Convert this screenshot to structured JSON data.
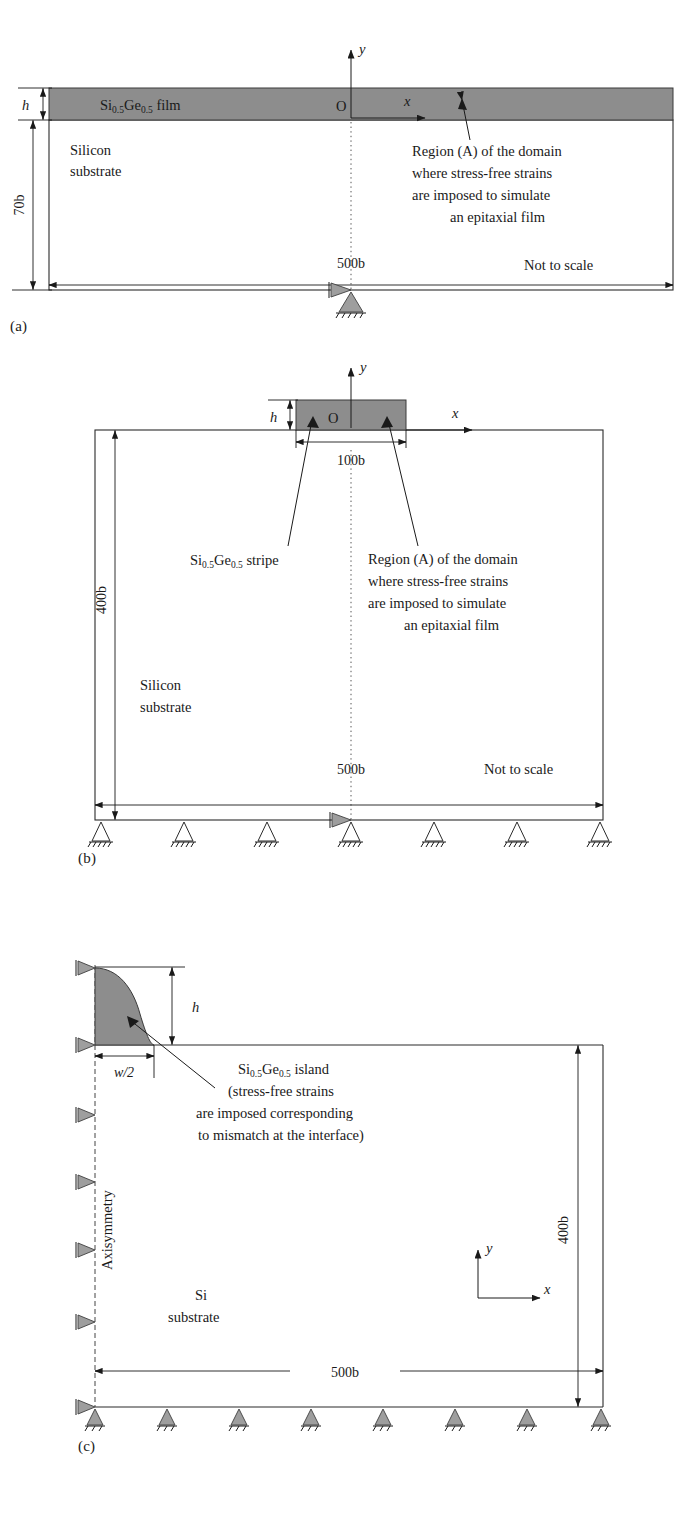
{
  "figure": {
    "type": "technical-diagram"
  },
  "panels": [
    {
      "id": "a",
      "label": "(a)",
      "film_label": "Si",
      "film_sub1": "0.5",
      "film_label2": "Ge",
      "film_sub2": "0.5",
      "film_suffix": " film",
      "substrate_line1": "Silicon",
      "substrate_line2": "substrate",
      "height_label": "h",
      "depth_label": "70b",
      "width_label": "500b",
      "origin_label": "O",
      "axis_y": "y",
      "axis_x": "x",
      "note": "Not to scale",
      "callout": [
        "Region (A) of the domain",
        "where stress-free strains",
        "are imposed to simulate",
        "an epitaxial film"
      ]
    },
    {
      "id": "b",
      "label": "(b)",
      "stripe_label": "Si",
      "stripe_sub1": "0.5",
      "stripe_label2": "Ge",
      "stripe_sub2": "0.5",
      "stripe_suffix": " stripe",
      "substrate_line1": "Silicon",
      "substrate_line2": "substrate",
      "height_label": "h",
      "stripe_width_label": "100b",
      "depth_label": "400b",
      "width_label": "500b",
      "origin_label": "O",
      "axis_y": "y",
      "axis_x": "x",
      "note": "Not to scale",
      "callout": [
        "Region (A) of the domain",
        "where stress-free strains",
        "are imposed to simulate",
        "an epitaxial film"
      ],
      "support_count": 7
    },
    {
      "id": "c",
      "label": "(c)",
      "island_label": "Si",
      "island_sub1": "0.5",
      "island_label2": "Ge",
      "island_sub2": "0.5",
      "island_suffix": " island",
      "callout": [
        "(stress-free strains",
        "are imposed corresponding",
        "to mismatch at the interface)"
      ],
      "height_label": "h",
      "halfwidth_label": "w/2",
      "axisymmetry_label": "Axisymmetry",
      "substrate_line1": "Si",
      "substrate_line2": "substrate",
      "depth_label": "400b",
      "width_label": "500b",
      "axis_y": "y",
      "axis_x": "x",
      "bottom_support_count": 8,
      "left_support_count": 6
    }
  ],
  "colors": {
    "film_fill": "#8d8d8d",
    "line": "#1a1a1a",
    "support_fill": "#9e9e9e",
    "dotted_line": "#555555",
    "background": "#ffffff"
  }
}
